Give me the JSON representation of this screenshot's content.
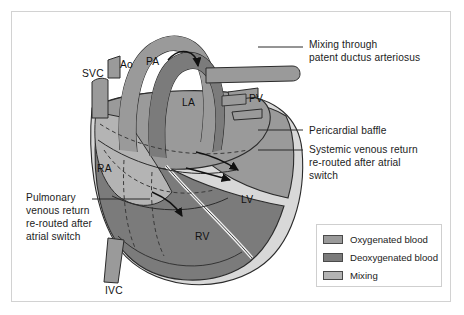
{
  "figure": {
    "background": "#ffffff",
    "border_color": "#d2d2d2"
  },
  "palette": {
    "oxygenated": "#9a9a9a",
    "deoxygenated": "#7b7b7b",
    "mixing": "#b4b4b4",
    "outline": "#2b2b2b",
    "pale": "#d8d8d8",
    "text": "#1c1c1c"
  },
  "structures": [
    {
      "id": "svc",
      "label": "SVC",
      "x": 82,
      "y": 75,
      "full_name": "superior vena cava"
    },
    {
      "id": "ao",
      "label": "Ao",
      "x": 120,
      "y": 66,
      "full_name": "aorta"
    },
    {
      "id": "pa",
      "label": "PA",
      "x": 146,
      "y": 63,
      "full_name": "pulmonary artery"
    },
    {
      "id": "la",
      "label": "LA",
      "x": 182,
      "y": 104,
      "full_name": "left atrium"
    },
    {
      "id": "pv",
      "label": "PV",
      "x": 249,
      "y": 100,
      "full_name": "pulmonary veins"
    },
    {
      "id": "ra",
      "label": "RA",
      "x": 97,
      "y": 170,
      "full_name": "right atrium"
    },
    {
      "id": "lv",
      "label": "LV",
      "x": 241,
      "y": 201,
      "full_name": "left ventricle"
    },
    {
      "id": "rv",
      "label": "RV",
      "x": 195,
      "y": 238,
      "full_name": "right ventricle"
    },
    {
      "id": "ivc",
      "label": "IVC",
      "x": 105,
      "y": 292,
      "full_name": "inferior vena cava"
    }
  ],
  "annotations": [
    {
      "id": "pda",
      "text": "Mixing through\npatent ductus arteriosus",
      "x": 309,
      "y": 38,
      "leader": {
        "x1": 258,
        "y1": 47,
        "x2": 303,
        "y2": 47
      }
    },
    {
      "id": "baffle",
      "text": "Pericardial baffle",
      "x": 309,
      "y": 125,
      "leader": {
        "x1": 258,
        "y1": 130,
        "x2": 303,
        "y2": 130
      }
    },
    {
      "id": "systemic-venous-return",
      "text": "Systemic venous return\nre-routed after atrial\nswitch",
      "x": 309,
      "y": 145,
      "leader": {
        "x1": 258,
        "y1": 150,
        "x2": 303,
        "y2": 150
      }
    },
    {
      "id": "pulmonary-venous-return",
      "text": "Pulmonary\nvenous return\nre-routed after\natrial switch",
      "x": 26,
      "y": 192,
      "leader": {
        "x1": 92,
        "y1": 199,
        "x2": 150,
        "y2": 199
      }
    }
  ],
  "legend": {
    "items": [
      {
        "label": "Oxygenated blood",
        "color": "#9a9a9a"
      },
      {
        "label": "Deoxygenated blood",
        "color": "#7b7b7b"
      },
      {
        "label": "Mixing",
        "color": "#b4b4b4"
      }
    ]
  }
}
